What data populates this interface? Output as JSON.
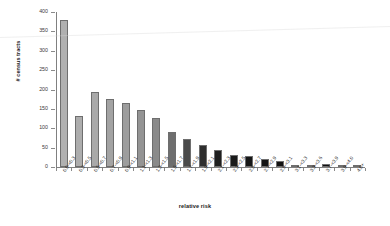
{
  "chart_data": {
    "type": "bar",
    "title": "",
    "xlabel": "relative risk",
    "ylabel": "# census tracts",
    "ylim": [
      0,
      400
    ],
    "ytick_values": [
      400,
      350,
      300,
      250,
      200,
      150,
      100,
      50,
      0
    ],
    "ytick_labels": [
      "400",
      "350",
      "300",
      "250",
      "200",
      "150",
      "100",
      "50",
      "0"
    ],
    "grid": false,
    "legend": "none",
    "categories": [
      "0.0-<0.3",
      "0.3-<0.5",
      "0.5-<0.7",
      "0.7-<0.9",
      "0.9-<1.1",
      "1.1-<1.3",
      "1.3-<1.5",
      "1.5-<1.7",
      "1.7-<1.9",
      "1.9-<2.1",
      "2.1-<2.3",
      "2.3-<2.5",
      "2.5-<2.7",
      "2.7-<2.9",
      "2.9-<3.1",
      "3.1-<3.3",
      "3.3-<3.6",
      "3.7-<3.9",
      "3.9-<4.0",
      "4.0+"
    ],
    "values": [
      380,
      132,
      194,
      176,
      166,
      147,
      126,
      90,
      72,
      57,
      44,
      32,
      29,
      21,
      16,
      5,
      3,
      7,
      2,
      6
    ],
    "bar_colors": [
      "#b0b0b0",
      "#adadad",
      "#a9a9a9",
      "#a3a3a3",
      "#9d9d9d",
      "#949494",
      "#8a8a8a",
      "#6e6e6e",
      "#4a4a4a",
      "#2e2e2e",
      "#1f1f1f",
      "#1a1a1a",
      "#161616",
      "#141414",
      "#121212",
      "#111111",
      "#101010",
      "#101010",
      "#0f0f0f",
      "#0f0f0f"
    ]
  },
  "axes": {
    "x_title": "relative risk",
    "y_title": "# census tracts"
  }
}
